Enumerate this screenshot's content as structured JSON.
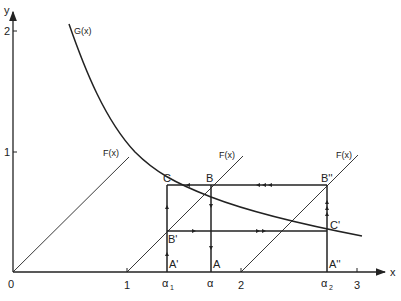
{
  "diagram": {
    "axes": {
      "x_label": "x",
      "y_label": "y",
      "origin_label": "0",
      "x_ticks": [
        "1",
        "2",
        "3"
      ],
      "y_ticks": [
        "1",
        "2"
      ],
      "x_markers": {
        "alpha1": {
          "base": "α",
          "sub": "1"
        },
        "alpha": {
          "base": "α"
        },
        "alpha2": {
          "base": "α",
          "sub": "2"
        }
      }
    },
    "curves": {
      "G": {
        "label": "G(x)"
      },
      "F_lines": [
        {
          "label": "F(x)",
          "start_x": 0
        },
        {
          "label": "F(x)",
          "start_x": 1
        },
        {
          "label": "F(x)",
          "start_x": 2
        }
      ]
    },
    "points": {
      "C": "C",
      "B": "B",
      "B_double": "B''",
      "B_prime": "B'",
      "C_prime": "C'",
      "A_prime": "A'",
      "A": "A",
      "A_double": "A''"
    },
    "colors": {
      "line": "#222222",
      "background": "#ffffff"
    }
  }
}
